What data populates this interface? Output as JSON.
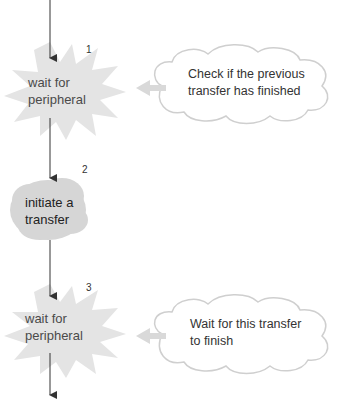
{
  "diagram": {
    "type": "flowchart",
    "nodes": [
      {
        "id": 1,
        "number": "1",
        "line1": "wait for",
        "line2": "peripheral",
        "shape": "starburst"
      },
      {
        "id": 2,
        "number": "2",
        "line1": "initiate a",
        "line2": "transfer",
        "shape": "cloud"
      },
      {
        "id": 3,
        "number": "3",
        "line1": "wait for",
        "line2": "peripheral",
        "shape": "starburst"
      }
    ],
    "notes": [
      {
        "target": 1,
        "line1": "Check if the previous",
        "line2": "transfer has finished"
      },
      {
        "target": 3,
        "line1": "Wait for this transfer",
        "line2": "to finish"
      }
    ],
    "colors": {
      "starburst_fill": "#e4e4e4",
      "cloud_fill": "#d6d6d6",
      "note_outline": "#cfcfcf",
      "arrow_gray": "#d9d9d9",
      "flow_line": "#333333"
    }
  }
}
